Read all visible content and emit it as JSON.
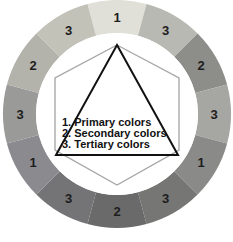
{
  "figure": {
    "name": "color-wheel-diagram",
    "background": "#ffffff",
    "center": {
      "x": 117,
      "y": 114
    },
    "outer_radius": 114,
    "inner_radius": 81,
    "segment_count": 12
  },
  "wheel": {
    "segments": [
      {
        "index": 0,
        "label": "1",
        "color": "#e0e0d8",
        "angle_start": -105,
        "angle_end": -75,
        "label_angle": -90,
        "role": "primary"
      },
      {
        "index": 1,
        "label": "3",
        "color": "#b9b9b3",
        "angle_start": -75,
        "angle_end": -45,
        "label_angle": -60,
        "role": "tertiary"
      },
      {
        "index": 2,
        "label": "2",
        "color": "#8d8d8a",
        "angle_start": -45,
        "angle_end": -15,
        "label_angle": -30,
        "role": "secondary"
      },
      {
        "index": 3,
        "label": "3",
        "color": "#a6a6a2",
        "angle_start": -15,
        "angle_end": 15,
        "label_angle": 0,
        "role": "tertiary"
      },
      {
        "index": 4,
        "label": "1",
        "color": "#8a8a88",
        "angle_start": 15,
        "angle_end": 45,
        "label_angle": 30,
        "role": "primary"
      },
      {
        "index": 5,
        "label": "3",
        "color": "#767674",
        "angle_start": 45,
        "angle_end": 75,
        "label_angle": 60,
        "role": "tertiary"
      },
      {
        "index": 6,
        "label": "2",
        "color": "#6a6a6a",
        "angle_start": 75,
        "angle_end": 105,
        "label_angle": 90,
        "role": "secondary"
      },
      {
        "index": 7,
        "label": "3",
        "color": "#747476",
        "angle_start": 105,
        "angle_end": 135,
        "label_angle": 120,
        "role": "tertiary"
      },
      {
        "index": 8,
        "label": "1",
        "color": "#8b8b8f",
        "angle_start": 135,
        "angle_end": 165,
        "label_angle": 150,
        "role": "primary"
      },
      {
        "index": 9,
        "label": "3",
        "color": "#9a9a99",
        "angle_start": 165,
        "angle_end": 195,
        "label_angle": 180,
        "role": "tertiary"
      },
      {
        "index": 10,
        "label": "2",
        "color": "#b3b3ab",
        "angle_start": 195,
        "angle_end": 225,
        "label_angle": 210,
        "role": "secondary"
      },
      {
        "index": 11,
        "label": "3",
        "color": "#c2c2b9",
        "angle_start": 225,
        "angle_end": 255,
        "label_angle": 240,
        "role": "tertiary"
      }
    ],
    "label_radius": 97
  },
  "inner_disc": {
    "fill": "#ffffff",
    "radius": 81
  },
  "hexagon": {
    "name": "secondary-hexagon",
    "stroke": "#a8a8a8",
    "stroke_width": 1.4,
    "fill": "none",
    "points": "117,45 179,78 179,150 117,185 55,150 55,78"
  },
  "triangle": {
    "name": "primary-triangle",
    "stroke": "#111111",
    "stroke_width": 2,
    "fill": "none",
    "points": "117,45 178,155 56,155"
  },
  "legend": {
    "lines": [
      "1. Primary colors",
      "2. Secondary colors",
      "3. Tertiary colors"
    ],
    "text_color": "#121212",
    "x": 62,
    "y_start": 126,
    "line_height": 11
  }
}
